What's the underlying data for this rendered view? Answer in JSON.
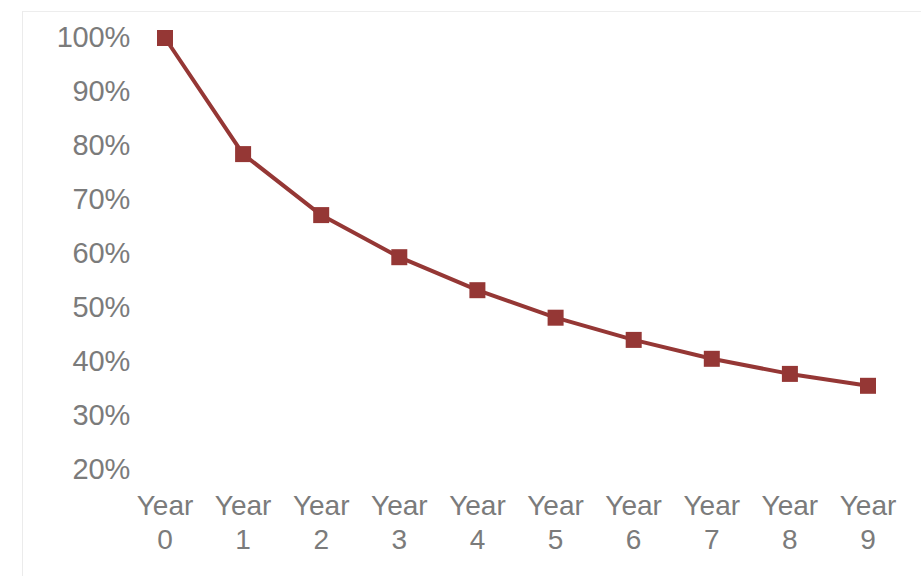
{
  "chart_data": {
    "type": "line",
    "title": "",
    "subtitle": "",
    "xlabel": "",
    "ylabel": "",
    "categories": [
      "Year 0",
      "Year 1",
      "Year 2",
      "Year 3",
      "Year 4",
      "Year 5",
      "Year 6",
      "Year 7",
      "Year 8",
      "Year 9"
    ],
    "x": [
      0,
      1,
      2,
      3,
      4,
      5,
      6,
      7,
      8,
      9
    ],
    "values": [
      100,
      78.5,
      67.2,
      59.4,
      53.3,
      48.2,
      44.1,
      40.6,
      37.8,
      35.6
    ],
    "value_suffix": "%",
    "series": [
      {
        "name": "",
        "values": [
          100,
          78.5,
          67.2,
          59.4,
          53.3,
          48.2,
          44.1,
          40.6,
          37.8,
          35.6
        ],
        "color": "#953735",
        "marker": "square",
        "line_width": 4
      }
    ],
    "ylim": [
      20,
      100
    ],
    "yticks": [
      100,
      90,
      80,
      70,
      60,
      50,
      40,
      30,
      20
    ],
    "ytick_labels": [
      "100%",
      "90%",
      "80%",
      "70%",
      "60%",
      "50%",
      "40%",
      "30%",
      "20%"
    ],
    "xtick_labels": [
      {
        "line1": "Year",
        "line2": "0"
      },
      {
        "line1": "Year",
        "line2": "1"
      },
      {
        "line1": "Year",
        "line2": "2"
      },
      {
        "line1": "Year",
        "line2": "3"
      },
      {
        "line1": "Year",
        "line2": "4"
      },
      {
        "line1": "Year",
        "line2": "5"
      },
      {
        "line1": "Year",
        "line2": "6"
      },
      {
        "line1": "Year",
        "line2": "7"
      },
      {
        "line1": "Year",
        "line2": "8"
      },
      {
        "line1": "Year",
        "line2": "9"
      }
    ],
    "grid": false,
    "legend": false,
    "legend_position": "none",
    "background_color": "#ffffff",
    "axis_text_color": "#7b7b7b",
    "plot_border_color": "#ececec"
  },
  "layout": {
    "plot_left_px": 165,
    "plot_right_px": 868,
    "y_top_px": 38,
    "y_bottom_px": 470,
    "y_top_value": 100,
    "y_bottom_value": 20,
    "y_label_right_px": 122,
    "x_axis_top_px": 489
  }
}
